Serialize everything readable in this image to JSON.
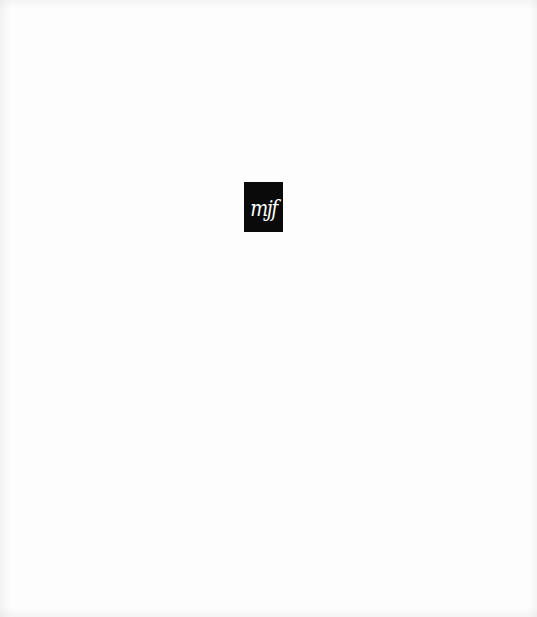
{
  "page": {
    "background_color": "#fdfdfd"
  },
  "logo": {
    "text": "mjf",
    "background_color": "#0a0a0a",
    "text_color": "#ffffff",
    "icon": "mjf-monogram-logo"
  }
}
